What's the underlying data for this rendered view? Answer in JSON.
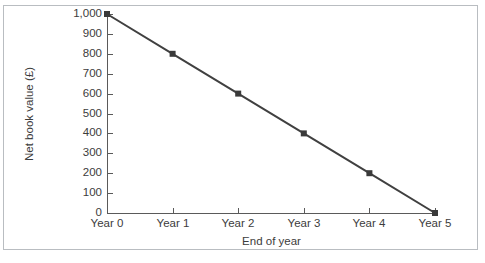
{
  "chart_data": {
    "type": "line",
    "title": "",
    "xlabel": "End of year",
    "ylabel": "Net book value (£)",
    "categories": [
      "Year 0",
      "Year 1",
      "Year 2",
      "Year 3",
      "Year 4",
      "Year 5"
    ],
    "x": [
      0,
      1,
      2,
      3,
      4,
      5
    ],
    "values": [
      1000,
      800,
      600,
      400,
      200,
      0
    ],
    "series": [
      {
        "name": "Net book value",
        "values": [
          1000,
          800,
          600,
          400,
          200,
          0
        ],
        "color": "#404040",
        "marker": "square",
        "marker_color": "#3a3a3a"
      }
    ],
    "ylim": [
      0,
      1000
    ],
    "xlim": [
      0,
      5
    ],
    "ytick_labels": [
      "1,000",
      "900",
      "800",
      "700",
      "600",
      "500",
      "400",
      "300",
      "200",
      "100",
      "0"
    ],
    "ytick_values": [
      1000,
      900,
      800,
      700,
      600,
      500,
      400,
      300,
      200,
      100,
      0
    ],
    "xtick_labels": [
      "Year 0",
      "Year 1",
      "Year 2",
      "Year 3",
      "Year 4",
      "Year 5"
    ],
    "grid": false,
    "legend": false,
    "legend_position": "none"
  },
  "figure": {
    "background_color": "#ffffff",
    "frame_color": "#b9bdc1",
    "axis_color": "#5a5a5a",
    "text_color": "#3c3c3c"
  }
}
